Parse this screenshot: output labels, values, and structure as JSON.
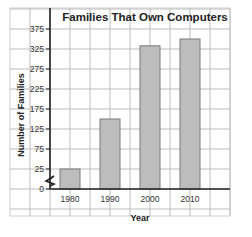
{
  "chart_data": {
    "type": "bar",
    "title": "Families That Own Computers",
    "xlabel": "Year",
    "ylabel": "Number of Families",
    "categories": [
      "1980",
      "1990",
      "2000",
      "2010"
    ],
    "values": [
      25,
      150,
      333,
      350
    ],
    "yticks": [
      0,
      25,
      75,
      125,
      175,
      225,
      275,
      325,
      375
    ],
    "ylim": [
      0,
      375
    ],
    "axis_break": "between 0 and 25",
    "grid": true,
    "legend": null,
    "bar_color": "#bdbdbd"
  }
}
